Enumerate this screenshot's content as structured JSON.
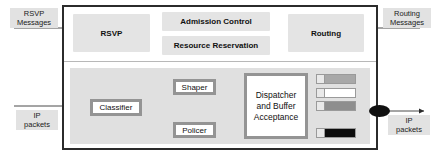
{
  "diagram": {
    "external_labels": {
      "rsvp_messages": "RSVP\nMessages",
      "rsvp_messages_line1": "RSVP",
      "rsvp_messages_line2": "Messages",
      "routing_messages_line1": "Routing",
      "routing_messages_line2": "Messages",
      "ip_packets_in_line1": "IP",
      "ip_packets_in_line2": "packets",
      "ip_packets_out_line1": "IP",
      "ip_packets_out_line2": "packets"
    },
    "control_plane": {
      "blocks": [
        {
          "id": "rsvp",
          "label": "RSVP"
        },
        {
          "id": "admission-control",
          "label": "Admission Control"
        },
        {
          "id": "resource-reservation",
          "label": "Resource Reservation"
        },
        {
          "id": "routing",
          "label": "Routing"
        }
      ]
    },
    "data_plane": {
      "blocks": [
        {
          "id": "classifier",
          "label": "Classifier"
        },
        {
          "id": "shaper",
          "label": "Shaper"
        },
        {
          "id": "policer",
          "label": "Policer"
        },
        {
          "id": "dispatcher",
          "label_line1": "Dispatcher",
          "label_line2": "and Buffer",
          "label_line3": "Acceptance"
        }
      ],
      "queues": [
        {
          "id": "queue-1",
          "fill": "#a8a8a8"
        },
        {
          "id": "queue-2",
          "fill": "#ffffff"
        },
        {
          "id": "queue-3",
          "fill": "#8e8e8e"
        },
        {
          "id": "queue-4",
          "fill": "#0d0d0d"
        }
      ],
      "scheduler": {
        "id": "scheduler",
        "shape": "ellipse",
        "color": "#111111"
      }
    },
    "colors": {
      "frame_border": "#2b2b2b",
      "control_block_fill": "#e4e4e4",
      "data_panel_fill": "#e0e0e0",
      "label_fill": "#e2e2e2",
      "box_border": "#949494",
      "line": "#4a4a4a"
    }
  }
}
